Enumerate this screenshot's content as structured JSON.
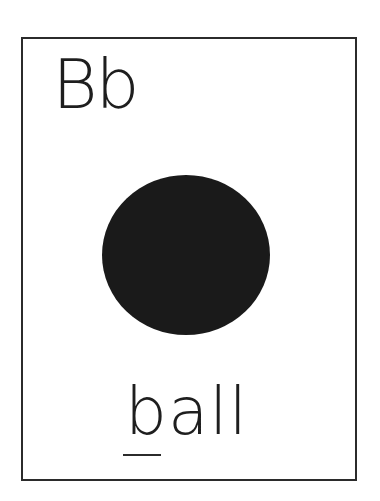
{
  "flashcard": {
    "letters": "Bb",
    "picture": {
      "icon": "ball-icon",
      "shape": "filled circle",
      "color": "#1a1a1a"
    },
    "word": "ball",
    "underlined_letter": "b",
    "colors": {
      "border": "#2b2b2b",
      "text": "#1e1e1e",
      "background": "#ffffff"
    }
  }
}
